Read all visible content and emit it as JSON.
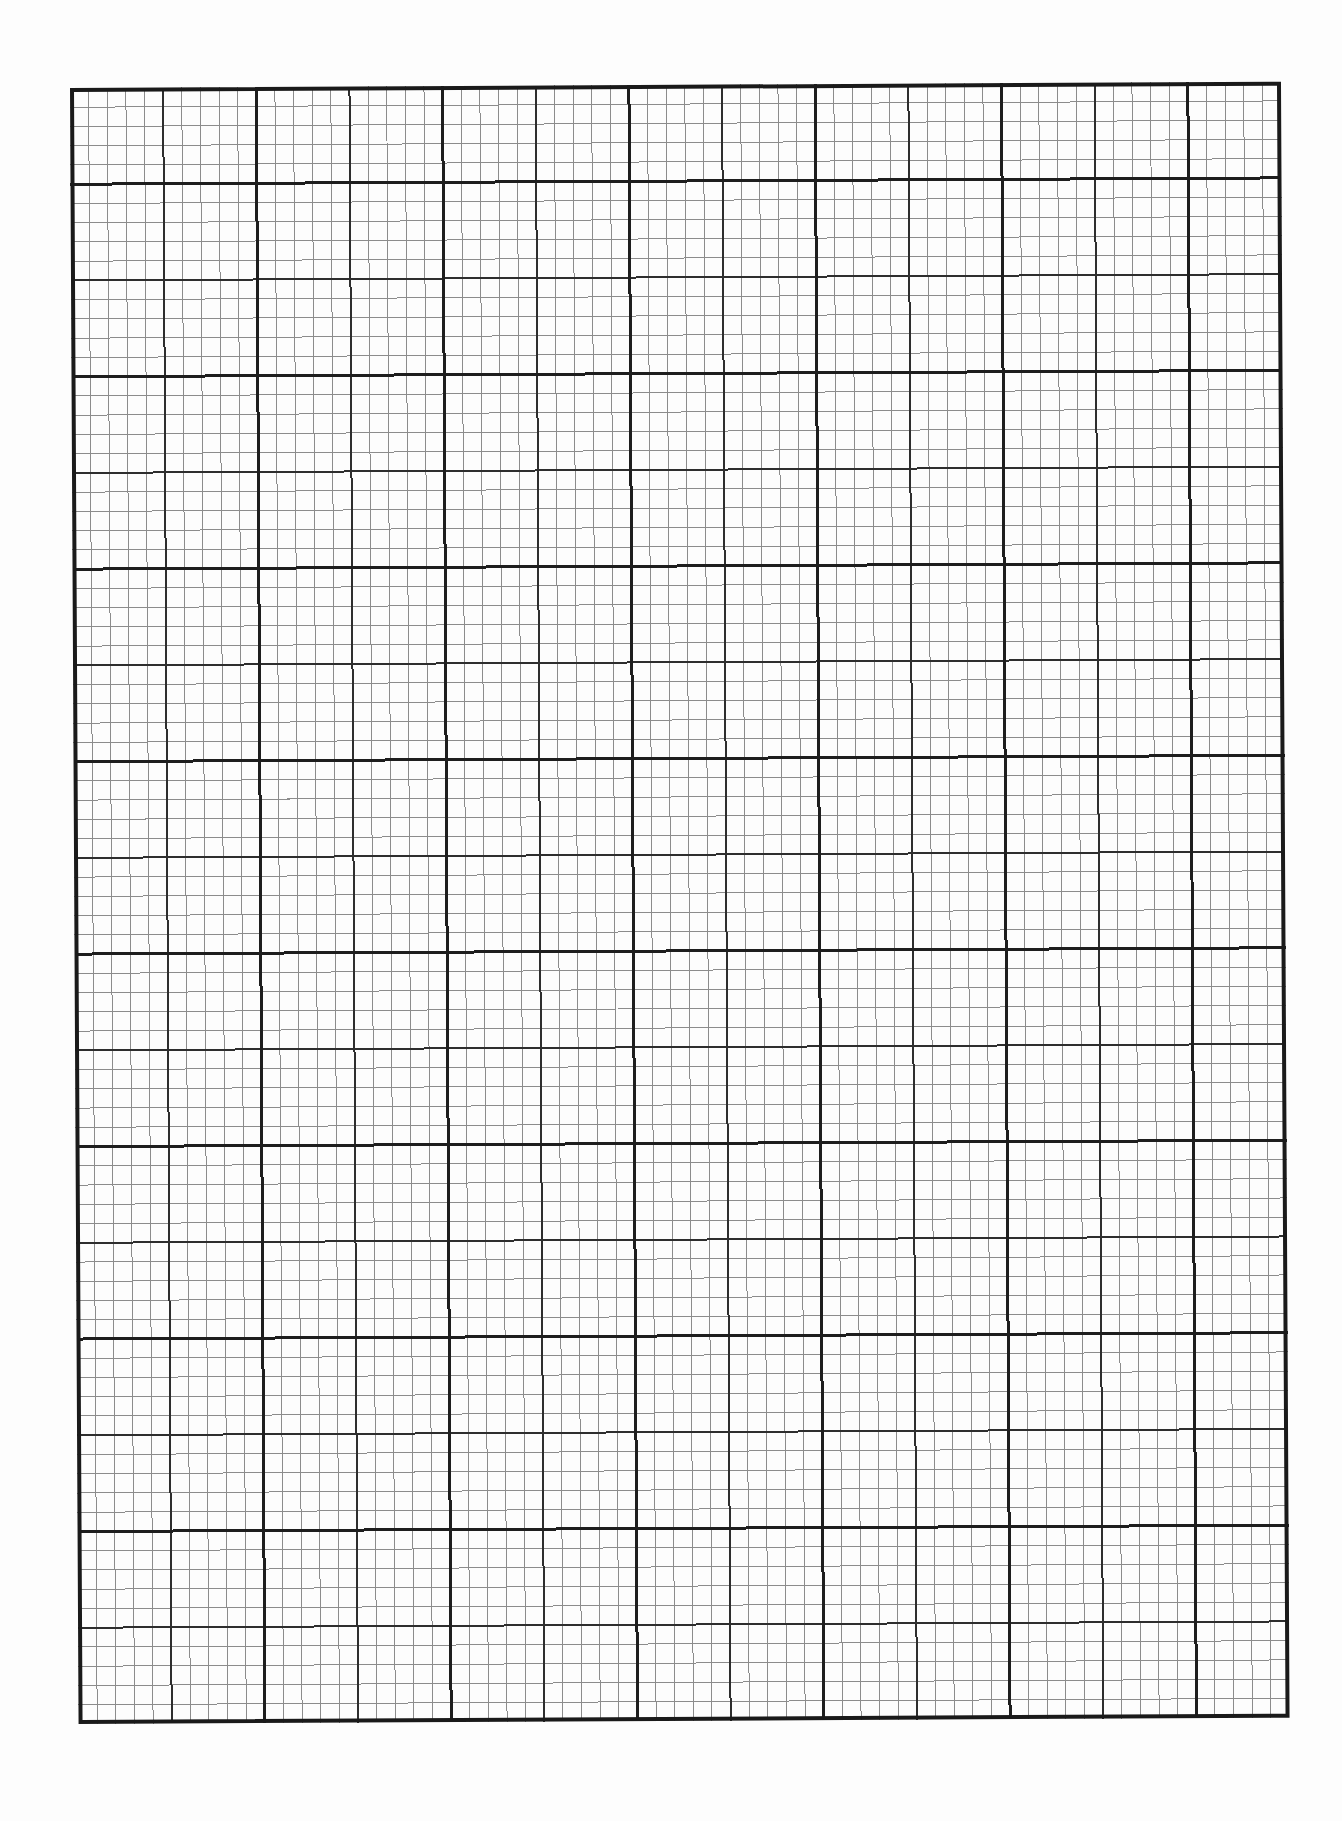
{
  "document": {
    "type": "graph-paper",
    "background_color": "#fdfdfd"
  },
  "grid": {
    "left": 70,
    "top": 88,
    "width": 1211,
    "height": 1636,
    "skew_deg": 0.3,
    "major_columns": 13,
    "major_rows": 17,
    "minor_per_major": 5,
    "thick_column_parity": "even",
    "thick_row_parity": "odd",
    "styles": {
      "border": {
        "color": "#1a1a1a",
        "width": 4
      },
      "thick": {
        "color": "#1e1e1e",
        "width": 3
      },
      "medium": {
        "color": "#2e2e2e",
        "width": 2
      },
      "minor": {
        "color": "#8c8c8c",
        "width": 1
      }
    }
  }
}
